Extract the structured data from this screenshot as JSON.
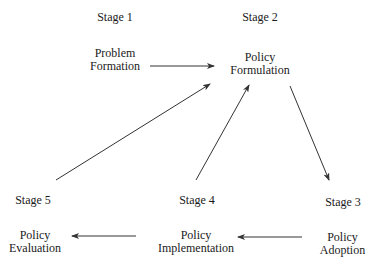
{
  "diagram": {
    "nodes": [
      {
        "id": "s1",
        "stage": "Stage 1",
        "label_line1": "Problem",
        "label_line2": "Formation"
      },
      {
        "id": "s2",
        "stage": "Stage 2",
        "label_line1": "Policy",
        "label_line2": "Formulation"
      },
      {
        "id": "s3",
        "stage": "Stage 3",
        "label_line1": "Policy",
        "label_line2": "Adoption"
      },
      {
        "id": "s4",
        "stage": "Stage 4",
        "label_line1": "Policy",
        "label_line2": "Implementation"
      },
      {
        "id": "s5",
        "stage": "Stage 5",
        "label_line1": "Policy",
        "label_line2": "Evaluation"
      }
    ],
    "edges": [
      {
        "from": "s1",
        "to": "s2"
      },
      {
        "from": "s2",
        "to": "s3"
      },
      {
        "from": "s3",
        "to": "s4"
      },
      {
        "from": "s4",
        "to": "s5"
      },
      {
        "from": "s4",
        "to": "s2"
      },
      {
        "from": "s5",
        "to": "s2"
      }
    ],
    "line_color": "#333333"
  }
}
